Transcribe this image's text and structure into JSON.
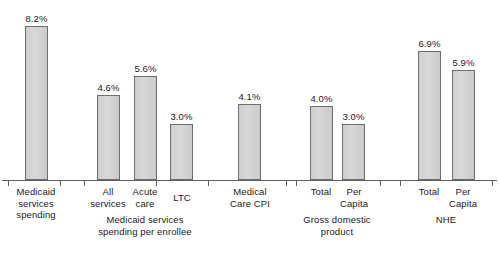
{
  "chart_data": {
    "type": "bar",
    "title": "",
    "subtitle": "",
    "xlabel": "",
    "ylabel": "",
    "ylim": [
      0,
      8.6
    ],
    "grid": false,
    "legend": "none",
    "value_suffix": "%",
    "categories": [
      "Medicaid services spending",
      "All services",
      "Acute care",
      "LTC",
      "Medical Care CPI",
      "Total",
      "Per Capita",
      "Total",
      "Per Capita"
    ],
    "values": [
      8.2,
      4.6,
      5.6,
      3.0,
      4.1,
      4.0,
      3.0,
      6.9,
      5.9
    ],
    "value_labels": [
      "8.2%",
      "4.6%",
      "5.6%",
      "3.0%",
      "4.1%",
      "4.0%",
      "3.0%",
      "6.9%",
      "5.9%"
    ],
    "groups": [
      {
        "label": "",
        "tick_labels": [
          "Medicaid\nservices\nspending"
        ]
      },
      {
        "label": "Medicaid services\nspending per enrollee",
        "tick_labels": [
          "All\nservices",
          "Acute\ncare",
          "LTC"
        ]
      },
      {
        "label": "",
        "tick_labels": [
          "Medical\nCare CPI"
        ]
      },
      {
        "label": "Gross domestic\nproduct",
        "tick_labels": [
          "Total",
          "Per\nCapita"
        ]
      },
      {
        "label": "NHE",
        "tick_labels": [
          "Total",
          "Per\nCapita"
        ]
      }
    ]
  },
  "bars": [
    {
      "label": "8.2%",
      "x": 25,
      "w": 23,
      "h": 154
    },
    {
      "label": "4.6%",
      "x": 97,
      "w": 23,
      "h": 85
    },
    {
      "label": "5.6%",
      "x": 134,
      "w": 23,
      "h": 104
    },
    {
      "label": "3.0%",
      "x": 170,
      "w": 23,
      "h": 56
    },
    {
      "label": "4.1%",
      "x": 238,
      "w": 23,
      "h": 76
    },
    {
      "label": "4.0%",
      "x": 310,
      "w": 23,
      "h": 74
    },
    {
      "label": "3.0%",
      "x": 342,
      "w": 23,
      "h": 56
    },
    {
      "label": "6.9%",
      "x": 418,
      "w": 23,
      "h": 129
    },
    {
      "label": "5.9%",
      "x": 452,
      "w": 23,
      "h": 110
    }
  ],
  "ticks": [
    8,
    60,
    84,
    156,
    208,
    286,
    296,
    380,
    400,
    492
  ],
  "tick_labels": [
    {
      "text": "Medicaid\nservices\nspending",
      "cx": 36,
      "top": 0
    },
    {
      "text": "All\nservices",
      "cx": 108,
      "top": 0
    },
    {
      "text": "Acute\ncare",
      "cx": 145,
      "top": 0
    },
    {
      "text": "LTC",
      "cx": 182,
      "top": 6
    },
    {
      "text": "Medical\nCare CPI",
      "cx": 250,
      "top": 0
    },
    {
      "text": "Total",
      "cx": 321,
      "top": 0
    },
    {
      "text": "Per\nCapita",
      "cx": 354,
      "top": 0
    },
    {
      "text": "Total",
      "cx": 429,
      "top": 0
    },
    {
      "text": "Per\nCapita",
      "cx": 463,
      "top": 0
    }
  ],
  "group_labels": [
    {
      "text": "Medicaid services\nspending per enrollee",
      "cx": 145,
      "top": 28
    },
    {
      "text": "Gross domestic\nproduct",
      "cx": 337,
      "top": 28
    },
    {
      "text": "NHE",
      "cx": 446,
      "top": 28
    }
  ]
}
